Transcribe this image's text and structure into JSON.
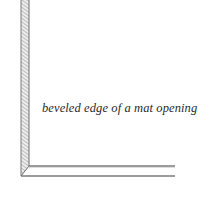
{
  "diagram": {
    "caption": "beveled edge of a mat opening",
    "colors": {
      "background": "#ffffff",
      "line": "#6e6e6e",
      "hatch": "#8a8a8a",
      "text": "#2a2a2a"
    }
  }
}
